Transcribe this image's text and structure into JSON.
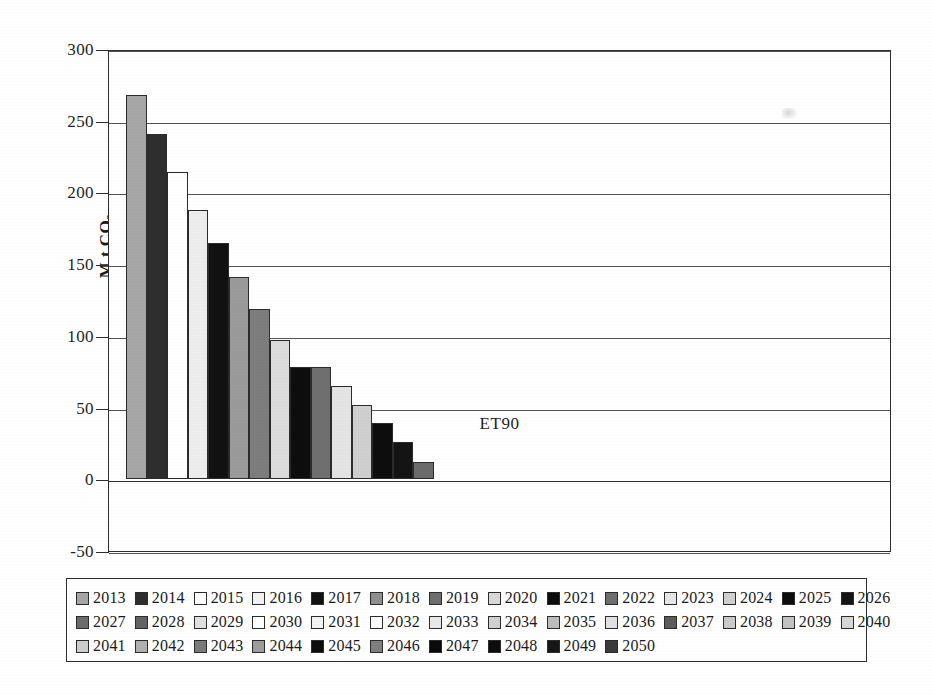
{
  "chart_data": {
    "type": "bar",
    "title": "",
    "subtitle": "",
    "xlabel": "",
    "ylabel": "M t CO2",
    "ylabel_display": "M t CO",
    "ylabel_sub": "2",
    "categories": [
      "ET90"
    ],
    "category_label": "ET90",
    "ylim": [
      -50,
      300
    ],
    "ytick_values": [
      300,
      250,
      200,
      150,
      100,
      50,
      0,
      -50
    ],
    "ytick_labels": [
      "300",
      "250",
      "200",
      "150",
      "100",
      "50",
      "0",
      "-50"
    ],
    "grid": true,
    "grid_axis": "y",
    "legend_position": "bottom",
    "series_label_note": "Each bar is one year; bars shown for 2013-2027, remaining years are zero",
    "bars": [
      {
        "year": "2013",
        "value": 268,
        "fill": "#a6a6a6"
      },
      {
        "year": "2014",
        "value": 241,
        "fill": "#2e2e2e"
      },
      {
        "year": "2015",
        "value": 214,
        "fill": "#ffffff"
      },
      {
        "year": "2016",
        "value": 188,
        "fill": "#ededed"
      },
      {
        "year": "2017",
        "value": 165,
        "fill": "#111111"
      },
      {
        "year": "2018",
        "value": 141,
        "fill": "#9a9a9a"
      },
      {
        "year": "2019",
        "value": 119,
        "fill": "#7d7d7d"
      },
      {
        "year": "2020",
        "value": 97,
        "fill": "#dcdcdc"
      },
      {
        "year": "2021",
        "value": 78,
        "fill": "#0d0d0d"
      },
      {
        "year": "2022",
        "value": 78,
        "fill": "#6f6f6f"
      },
      {
        "year": "2023",
        "value": 65,
        "fill": "#e4e4e4"
      },
      {
        "year": "2024",
        "value": 52,
        "fill": "#cfcfcf"
      },
      {
        "year": "2025",
        "value": 39,
        "fill": "#0d0d0d"
      },
      {
        "year": "2026",
        "value": 26,
        "fill": "#141414"
      },
      {
        "year": "2027",
        "value": 12,
        "fill": "#6b6b6b"
      }
    ],
    "series": [
      {
        "name": "ET90",
        "x": [
          "2013",
          "2014",
          "2015",
          "2016",
          "2017",
          "2018",
          "2019",
          "2020",
          "2021",
          "2022",
          "2023",
          "2024",
          "2025",
          "2026",
          "2027",
          "2028",
          "2029",
          "2030",
          "2031",
          "2032",
          "2033",
          "2034",
          "2035",
          "2036",
          "2037",
          "2038",
          "2039",
          "2040",
          "2041",
          "2042",
          "2043",
          "2044",
          "2045",
          "2046",
          "2047",
          "2048",
          "2049",
          "2050"
        ],
        "values": [
          268,
          241,
          214,
          188,
          165,
          141,
          119,
          97,
          78,
          78,
          65,
          52,
          39,
          26,
          12,
          0,
          0,
          0,
          0,
          0,
          0,
          0,
          0,
          0,
          0,
          0,
          0,
          0,
          0,
          0,
          0,
          0,
          0,
          0,
          0,
          0,
          0,
          0
        ]
      }
    ]
  },
  "legend": {
    "rows": [
      [
        {
          "label": "2013",
          "fill": "#a6a6a6"
        },
        {
          "label": "2014",
          "fill": "#2e2e2e"
        },
        {
          "label": "2015",
          "fill": "#ffffff"
        },
        {
          "label": "2016",
          "fill": "#f2f2f2"
        },
        {
          "label": "2017",
          "fill": "#111111"
        },
        {
          "label": "2018",
          "fill": "#8f8f8f"
        },
        {
          "label": "2019",
          "fill": "#6e6e6e"
        },
        {
          "label": "2020",
          "fill": "#d8d8d8"
        },
        {
          "label": "2021",
          "fill": "#0d0d0d"
        },
        {
          "label": "2022",
          "fill": "#6f6f6f"
        },
        {
          "label": "2023",
          "fill": "#e6e6e6"
        },
        {
          "label": "2024",
          "fill": "#cfcfcf"
        },
        {
          "label": "2025",
          "fill": "#0d0d0d"
        },
        {
          "label": "2026",
          "fill": "#141414"
        }
      ],
      [
        {
          "label": "2027",
          "fill": "#6b6b6b"
        },
        {
          "label": "2028",
          "fill": "#636363"
        },
        {
          "label": "2029",
          "fill": "#e0e0e0"
        },
        {
          "label": "2030",
          "fill": "#ffffff"
        },
        {
          "label": "2031",
          "fill": "#f4f4f4"
        },
        {
          "label": "2032",
          "fill": "#fbfbfb"
        },
        {
          "label": "2033",
          "fill": "#e8e8e8"
        },
        {
          "label": "2034",
          "fill": "#d0d0d0"
        },
        {
          "label": "2035",
          "fill": "#bdbdbd"
        },
        {
          "label": "2036",
          "fill": "#e2e2e2"
        },
        {
          "label": "2037",
          "fill": "#5c5c5c"
        },
        {
          "label": "2038",
          "fill": "#cacaca"
        },
        {
          "label": "2039",
          "fill": "#c2c2c2"
        },
        {
          "label": "2040",
          "fill": "#d6d6d6"
        }
      ],
      [
        {
          "label": "2041",
          "fill": "#cdcdcd"
        },
        {
          "label": "2042",
          "fill": "#b0b0b0"
        },
        {
          "label": "2043",
          "fill": "#7a7a7a"
        },
        {
          "label": "2044",
          "fill": "#9d9d9d"
        },
        {
          "label": "2045",
          "fill": "#0d0d0d"
        },
        {
          "label": "2046",
          "fill": "#7f7f7f"
        },
        {
          "label": "2047",
          "fill": "#0a0a0a"
        },
        {
          "label": "2048",
          "fill": "#0d0d0d"
        },
        {
          "label": "2049",
          "fill": "#161616"
        },
        {
          "label": "2050",
          "fill": "#3a3a3a"
        }
      ]
    ]
  },
  "colors": {
    "axis": "#2e2e2e",
    "grid": "#555555",
    "background": "#ffffff",
    "text": "#1a1a1a"
  }
}
